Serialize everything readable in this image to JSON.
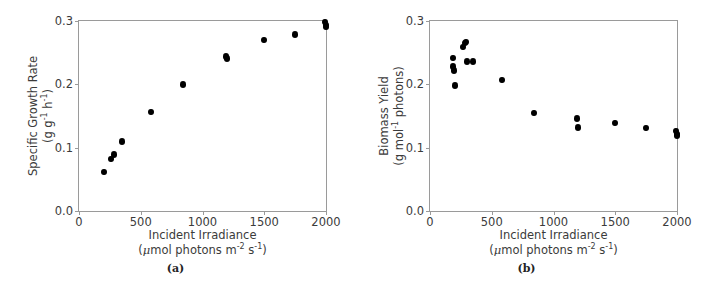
{
  "figure": {
    "panels": [
      {
        "id": "a",
        "caption": "(a)",
        "ylabel_line1": "Specific Growth Rate",
        "ylabel_line2_pre": "(g g",
        "ylabel_line2_sup1": "-1",
        "ylabel_line2_mid": " h",
        "ylabel_line2_sup2": "-1",
        "ylabel_line2_post": ")",
        "xlabel_line1": "Incident Irradiance",
        "xlabel_line2_pre": "(",
        "xlabel_line2_mu": "μ",
        "xlabel_line2_a": "mol photons m",
        "xlabel_line2_sup1": "-2",
        "xlabel_line2_b": " s",
        "xlabel_line2_sup2": "-1",
        "xlabel_line2_post": ")"
      },
      {
        "id": "b",
        "caption": "(b)",
        "ylabel_line1": "Biomass Yield",
        "ylabel_line2_pre": "(g mol",
        "ylabel_line2_sup1": "-1",
        "ylabel_line2_mid": " photons",
        "ylabel_line2_sup2": "",
        "ylabel_line2_post": ")",
        "xlabel_line1": "Incident Irradiance",
        "xlabel_line2_pre": "(",
        "xlabel_line2_mu": "μ",
        "xlabel_line2_a": "mol photons m",
        "xlabel_line2_sup1": "-2",
        "xlabel_line2_b": " s",
        "xlabel_line2_sup2": "-1",
        "xlabel_line2_post": ")"
      }
    ]
  },
  "chart_data": [
    {
      "type": "scatter",
      "panel": "a",
      "title": "",
      "xlabel": "Incident Irradiance (μmol photons m-2 s-1)",
      "ylabel": "Specific Growth Rate (g g-1 h-1)",
      "xlim": [
        0,
        2000
      ],
      "ylim": [
        0.0,
        0.3
      ],
      "xticks": [
        0,
        500,
        1000,
        1500,
        2000
      ],
      "xticklabels": [
        "0",
        "500",
        "1000",
        "1500",
        "2000"
      ],
      "yticks": [
        0.0,
        0.1,
        0.2,
        0.3
      ],
      "yticklabels": [
        "0.0",
        "0.1",
        "0.2",
        "0.3"
      ],
      "grid": false,
      "legend": null,
      "marker": "circle",
      "marker_color": "#000000",
      "points": [
        {
          "x": 200,
          "y": 0.062
        },
        {
          "x": 262,
          "y": 0.082
        },
        {
          "x": 285,
          "y": 0.089
        },
        {
          "x": 350,
          "y": 0.11
        },
        {
          "x": 580,
          "y": 0.156
        },
        {
          "x": 845,
          "y": 0.2
        },
        {
          "x": 1190,
          "y": 0.244
        },
        {
          "x": 1200,
          "y": 0.241
        },
        {
          "x": 1495,
          "y": 0.27
        },
        {
          "x": 1745,
          "y": 0.279
        },
        {
          "x": 1995,
          "y": 0.298
        },
        {
          "x": 2000,
          "y": 0.294
        },
        {
          "x": 2000,
          "y": 0.291
        }
      ]
    },
    {
      "type": "scatter",
      "panel": "b",
      "title": "",
      "xlabel": "Incident Irradiance (μmol photons m-2 s-1)",
      "ylabel": "Biomass Yield (g mol-1 photons)",
      "xlim": [
        0,
        2000
      ],
      "ylim": [
        0.0,
        0.3
      ],
      "xticks": [
        0,
        500,
        1000,
        1500,
        2000
      ],
      "xticklabels": [
        "0",
        "500",
        "1000",
        "1500",
        "2000"
      ],
      "yticks": [
        0.0,
        0.1,
        0.2,
        0.3
      ],
      "yticklabels": [
        "0.0",
        "0.1",
        "0.2",
        "0.3"
      ],
      "grid": false,
      "legend": null,
      "marker": "circle",
      "marker_color": "#000000",
      "points": [
        {
          "x": 185,
          "y": 0.242
        },
        {
          "x": 190,
          "y": 0.228
        },
        {
          "x": 195,
          "y": 0.222
        },
        {
          "x": 200,
          "y": 0.198
        },
        {
          "x": 270,
          "y": 0.259
        },
        {
          "x": 285,
          "y": 0.265
        },
        {
          "x": 292,
          "y": 0.267
        },
        {
          "x": 300,
          "y": 0.236
        },
        {
          "x": 350,
          "y": 0.236
        },
        {
          "x": 580,
          "y": 0.207
        },
        {
          "x": 845,
          "y": 0.155
        },
        {
          "x": 1190,
          "y": 0.146
        },
        {
          "x": 1195,
          "y": 0.132
        },
        {
          "x": 1495,
          "y": 0.139
        },
        {
          "x": 1745,
          "y": 0.131
        },
        {
          "x": 1995,
          "y": 0.126
        },
        {
          "x": 2000,
          "y": 0.122
        },
        {
          "x": 2000,
          "y": 0.119
        }
      ]
    }
  ]
}
